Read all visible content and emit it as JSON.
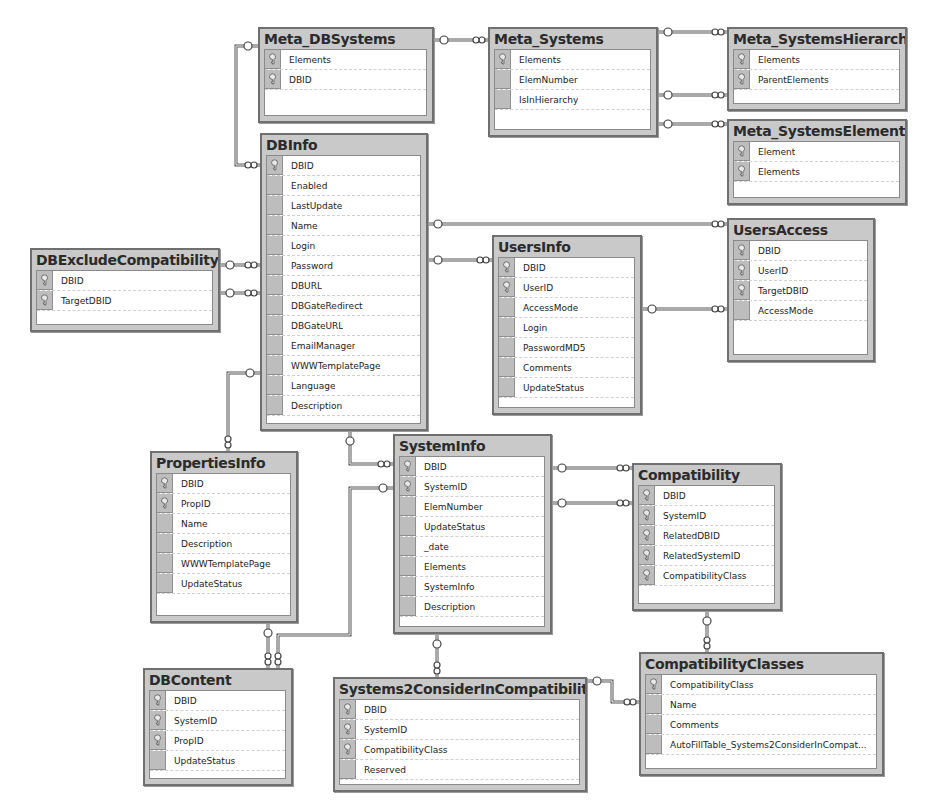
{
  "diagram": {
    "type": "database-schema",
    "tables": [
      {
        "id": "meta_dbsystems",
        "name": "Meta_DBSystems",
        "x": 258,
        "y": 27,
        "w": 176,
        "h": 96,
        "columns": [
          {
            "name": "Elements",
            "pk": true
          },
          {
            "name": "DBID",
            "pk": true
          }
        ]
      },
      {
        "id": "meta_systems",
        "name": "Meta_Systems",
        "x": 488,
        "y": 27,
        "w": 170,
        "h": 110,
        "columns": [
          {
            "name": "Elements",
            "pk": true
          },
          {
            "name": "ElemNumber",
            "pk": false
          },
          {
            "name": "IsInHierarchy",
            "pk": false
          }
        ]
      },
      {
        "id": "meta_systemshierarchy",
        "name": "Meta_SystemsHierarchy",
        "x": 727,
        "y": 27,
        "w": 180,
        "h": 84,
        "columns": [
          {
            "name": "Elements",
            "pk": true
          },
          {
            "name": "ParentElements",
            "pk": true
          }
        ]
      },
      {
        "id": "meta_systemselement",
        "name": "Meta_SystemsElement",
        "x": 727,
        "y": 119,
        "w": 180,
        "h": 86,
        "columns": [
          {
            "name": "Element",
            "pk": true
          },
          {
            "name": "Elements",
            "pk": true
          }
        ]
      },
      {
        "id": "dbinfo",
        "name": "DBInfo",
        "x": 260,
        "y": 133,
        "w": 168,
        "h": 298,
        "columns": [
          {
            "name": "DBID",
            "pk": true
          },
          {
            "name": "Enabled",
            "pk": false
          },
          {
            "name": "LastUpdate",
            "pk": false
          },
          {
            "name": "Name",
            "pk": false
          },
          {
            "name": "Login",
            "pk": false
          },
          {
            "name": "Password",
            "pk": false
          },
          {
            "name": "DBURL",
            "pk": false
          },
          {
            "name": "DBGateRedirect",
            "pk": false
          },
          {
            "name": "DBGateURL",
            "pk": false
          },
          {
            "name": "EmailManager",
            "pk": false
          },
          {
            "name": "WWWTemplatePage",
            "pk": false
          },
          {
            "name": "Language",
            "pk": false
          },
          {
            "name": "Description",
            "pk": false
          }
        ]
      },
      {
        "id": "dbexcludecompatibility",
        "name": "DBExcludeCompatibility",
        "x": 30,
        "y": 248,
        "w": 190,
        "h": 84,
        "columns": [
          {
            "name": "DBID",
            "pk": true
          },
          {
            "name": "TargetDBID",
            "pk": true
          }
        ]
      },
      {
        "id": "usersinfo",
        "name": "UsersInfo",
        "x": 492,
        "y": 235,
        "w": 150,
        "h": 180,
        "columns": [
          {
            "name": "DBID",
            "pk": true
          },
          {
            "name": "UserID",
            "pk": true
          },
          {
            "name": "AccessMode",
            "pk": false
          },
          {
            "name": "Login",
            "pk": false
          },
          {
            "name": "PasswordMD5",
            "pk": false
          },
          {
            "name": "Comments",
            "pk": false
          },
          {
            "name": "UpdateStatus",
            "pk": false
          }
        ]
      },
      {
        "id": "usersaccess",
        "name": "UsersAccess",
        "x": 727,
        "y": 218,
        "w": 148,
        "h": 144,
        "columns": [
          {
            "name": "DBID",
            "pk": true
          },
          {
            "name": "UserID",
            "pk": true
          },
          {
            "name": "TargetDBID",
            "pk": true
          },
          {
            "name": "AccessMode",
            "pk": false
          }
        ]
      },
      {
        "id": "propertiesinfo",
        "name": "PropertiesInfo",
        "x": 150,
        "y": 451,
        "w": 148,
        "h": 172,
        "columns": [
          {
            "name": "DBID",
            "pk": true
          },
          {
            "name": "PropID",
            "pk": true
          },
          {
            "name": "Name",
            "pk": false
          },
          {
            "name": "Description",
            "pk": false
          },
          {
            "name": "WWWTemplatePage",
            "pk": false
          },
          {
            "name": "UpdateStatus",
            "pk": false
          }
        ]
      },
      {
        "id": "systeminfo",
        "name": "SystemInfo",
        "x": 393,
        "y": 434,
        "w": 159,
        "h": 200,
        "columns": [
          {
            "name": "DBID",
            "pk": true
          },
          {
            "name": "SystemID",
            "pk": true
          },
          {
            "name": "ElemNumber",
            "pk": false
          },
          {
            "name": "UpdateStatus",
            "pk": false
          },
          {
            "name": "_date",
            "pk": false
          },
          {
            "name": "Elements",
            "pk": false
          },
          {
            "name": "SystemInfo",
            "pk": false
          },
          {
            "name": "Description",
            "pk": false
          }
        ]
      },
      {
        "id": "compatibility",
        "name": "Compatibility",
        "x": 632,
        "y": 463,
        "w": 150,
        "h": 148,
        "columns": [
          {
            "name": "DBID",
            "pk": true
          },
          {
            "name": "SystemID",
            "pk": true
          },
          {
            "name": "RelatedDBID",
            "pk": true
          },
          {
            "name": "RelatedSystemID",
            "pk": true
          },
          {
            "name": "CompatibilityClass",
            "pk": true
          }
        ]
      },
      {
        "id": "dbcontent",
        "name": "DBContent",
        "x": 143,
        "y": 668,
        "w": 150,
        "h": 118,
        "columns": [
          {
            "name": "DBID",
            "pk": true
          },
          {
            "name": "SystemID",
            "pk": true
          },
          {
            "name": "PropID",
            "pk": true
          },
          {
            "name": "UpdateStatus",
            "pk": false
          }
        ]
      },
      {
        "id": "systems2considerincompatibility",
        "name": "Systems2ConsiderInCompatibility",
        "x": 333,
        "y": 677,
        "w": 254,
        "h": 115,
        "columns": [
          {
            "name": "DBID",
            "pk": true
          },
          {
            "name": "SystemID",
            "pk": true
          },
          {
            "name": "CompatibilityClass",
            "pk": true
          },
          {
            "name": "Reserved",
            "pk": false
          }
        ]
      },
      {
        "id": "compatibilityclasses",
        "name": "CompatibilityClasses",
        "x": 639,
        "y": 652,
        "w": 245,
        "h": 124,
        "columns": [
          {
            "name": "CompatibilityClass",
            "pk": true
          },
          {
            "name": "Name",
            "pk": false
          },
          {
            "name": "Comments",
            "pk": false
          },
          {
            "name": "AutoFillTable_Systems2ConsiderInCompat...",
            "pk": false
          }
        ]
      }
    ],
    "relationships": [
      {
        "from": "meta_dbsystems",
        "to": "dbinfo",
        "path": [
          [
            258,
            46
          ],
          [
            236,
            46
          ],
          [
            236,
            165
          ],
          [
            260,
            165
          ]
        ]
      },
      {
        "from": "meta_dbsystems",
        "to": "meta_systems",
        "path": [
          [
            434,
            40
          ],
          [
            488,
            40
          ]
        ]
      },
      {
        "from": "meta_systems",
        "to": "meta_systemshierarchy",
        "path": [
          [
            658,
            32
          ],
          [
            727,
            32
          ]
        ]
      },
      {
        "from": "meta_systems",
        "to": "meta_systemshierarchy",
        "path": [
          [
            658,
            95
          ],
          [
            727,
            95
          ]
        ]
      },
      {
        "from": "meta_systems",
        "to": "meta_systemselement",
        "path": [
          [
            658,
            124
          ],
          [
            727,
            124
          ]
        ]
      },
      {
        "from": "dbinfo",
        "to": "usersaccess",
        "path": [
          [
            428,
            224
          ],
          [
            727,
            224
          ]
        ]
      },
      {
        "from": "dbinfo",
        "to": "usersinfo",
        "path": [
          [
            428,
            260
          ],
          [
            492,
            260
          ]
        ]
      },
      {
        "from": "usersinfo",
        "to": "usersaccess",
        "path": [
          [
            642,
            309
          ],
          [
            727,
            309
          ]
        ]
      },
      {
        "from": "dbexcludecompatibility",
        "to": "dbinfo",
        "path": [
          [
            220,
            265
          ],
          [
            260,
            265
          ]
        ]
      },
      {
        "from": "dbexcludecompatibility",
        "to": "dbinfo",
        "path": [
          [
            220,
            293
          ],
          [
            260,
            293
          ]
        ]
      },
      {
        "from": "dbinfo",
        "to": "propertiesinfo",
        "path": [
          [
            260,
            373
          ],
          [
            228,
            373
          ],
          [
            228,
            451
          ]
        ]
      },
      {
        "from": "dbinfo",
        "to": "systeminfo",
        "path": [
          [
            350,
            431
          ],
          [
            350,
            464
          ],
          [
            393,
            464
          ]
        ]
      },
      {
        "from": "systeminfo",
        "to": "compatibility",
        "path": [
          [
            552,
            468
          ],
          [
            632,
            468
          ]
        ]
      },
      {
        "from": "systeminfo",
        "to": "compatibility",
        "path": [
          [
            552,
            503
          ],
          [
            632,
            503
          ]
        ]
      },
      {
        "from": "systeminfo",
        "to": "dbcontent",
        "path": [
          [
            393,
            488
          ],
          [
            350,
            488
          ],
          [
            350,
            635
          ],
          [
            278,
            635
          ],
          [
            278,
            668
          ]
        ]
      },
      {
        "from": "propertiesinfo",
        "to": "dbcontent",
        "path": [
          [
            268,
            623
          ],
          [
            268,
            668
          ]
        ]
      },
      {
        "from": "systeminfo",
        "to": "systems2considerincompatibility",
        "path": [
          [
            437,
            634
          ],
          [
            437,
            677
          ]
        ]
      },
      {
        "from": "compatibility",
        "to": "compatibilityclasses",
        "path": [
          [
            707,
            611
          ],
          [
            707,
            652
          ]
        ]
      },
      {
        "from": "systems2considerincompatibility",
        "to": "compatibilityclasses",
        "path": [
          [
            587,
            681
          ],
          [
            612,
            681
          ],
          [
            612,
            702
          ],
          [
            639,
            702
          ]
        ]
      }
    ]
  },
  "colors": {
    "table_header": "#c9c9c9",
    "table_border": "#6f6f6f",
    "key_cell": "#bdbdbd",
    "link": "#555555",
    "background": "#ffffff"
  }
}
